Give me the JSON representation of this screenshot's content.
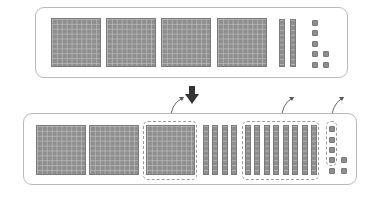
{
  "diagram": {
    "top_panel": {
      "hundreds": 4,
      "tens": 2,
      "ones": 7
    },
    "bottom_panel": {
      "hundreds": 3,
      "tens": 12,
      "ones": 7
    },
    "highlighted_groups": [
      "one hundred flat",
      "ten tens rods",
      "four ones"
    ],
    "colors": {
      "block_fill": "#8e8e8e",
      "panel_border": "#b9b9b9",
      "arrow": "#333333",
      "dash": "#9a9a9a"
    }
  }
}
